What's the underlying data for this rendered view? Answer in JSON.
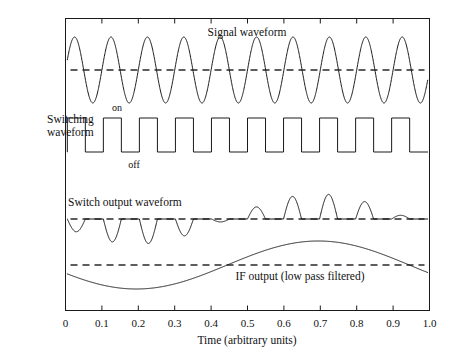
{
  "figure": {
    "x_axis": {
      "title": "Time (arbitrary units)",
      "ticks": [
        "0",
        "0.1",
        "0.2",
        "0.3",
        "0.4",
        "0.5",
        "0.6",
        "0.7",
        "0.8",
        "0.9",
        "1.0"
      ],
      "min": 0,
      "max": 1.0
    },
    "labels": {
      "signal": "Signal waveform",
      "switching_line1": "Switching",
      "switching_line2": "waveform",
      "on": "on",
      "off": "off",
      "switch_output": "Switch output waveform",
      "if_output": "IF output (low pass filtered)"
    },
    "colors": {
      "trace": "#1a1a1a",
      "frame": "#1a1a1a",
      "dashed_reference": "#2a2a2a",
      "background": "#ffffff"
    }
  },
  "chart_data": {
    "type": "line",
    "title": "",
    "xlabel": "Time (arbitrary units)",
    "ylabel": "",
    "xlim": [
      0,
      1.0
    ],
    "grid": false,
    "legend": "none",
    "xticks": [
      0,
      0.1,
      0.2,
      0.3,
      0.4,
      0.5,
      0.6,
      0.7,
      0.8,
      0.9,
      1.0
    ],
    "xticklabels": [
      "0",
      "0.1",
      "0.2",
      "0.3",
      "0.4",
      "0.5",
      "0.6",
      "0.7",
      "0.8",
      "0.9",
      "1.0"
    ],
    "annotations": [
      {
        "text": "Signal waveform",
        "x": 0.48,
        "y_panel": "signal"
      },
      {
        "text": "Switching",
        "x": -0.06,
        "y_panel": "switching"
      },
      {
        "text": "waveform",
        "x": -0.06,
        "y_panel": "switching"
      },
      {
        "text": "on",
        "x": 0.14,
        "y_panel": "switching"
      },
      {
        "text": "off",
        "x": 0.17,
        "y_panel": "switching"
      },
      {
        "text": "Switch output waveform",
        "x": 0.2,
        "y_panel": "switch_output"
      },
      {
        "text": "IF output (low pass filtered)",
        "x": 0.62,
        "y_panel": "if_output"
      }
    ],
    "series": [
      {
        "name": "Signal waveform",
        "panel": "signal",
        "waveform": "sine",
        "cycles": 10,
        "amplitude": 1.0,
        "phase_deg": 0,
        "reference_line": 0,
        "description": "Continuous RF sine wave, 10 cycles across 0 to 1.0 time units, symmetric about the dashed zero reference."
      },
      {
        "name": "Switching waveform",
        "panel": "switching",
        "waveform": "square",
        "cycles": 10,
        "duty": 0.5,
        "high_label": "on",
        "low_label": "off",
        "phase_deg": 0,
        "description": "Local-oscillator square wave gating the switch, 10 cycles, 50 percent duty, levels labelled on and off."
      },
      {
        "name": "Switch output waveform",
        "panel": "switch_output",
        "waveform": "gated_product",
        "cycles": 10,
        "beat_cycles": 1,
        "beat_phase_deg": 200,
        "reference_line": 0,
        "description": "Product of the signal and switching waveforms. Each switching period passes a half cycle of the signal whose polarity and size follow a slow beat envelope, negative excursions early in the record and positive excursions later."
      },
      {
        "name": "IF output (low pass filtered)",
        "panel": "if_output",
        "waveform": "sine",
        "cycles": 1,
        "amplitude": 1.0,
        "phase_deg": 200,
        "reference_line": 0,
        "minimum_at_x": 0.2,
        "maximum_at_x": 0.7,
        "zero_crossings_x": [
          0.45,
          0.95
        ],
        "description": "Low pass filtered beat note, one slow cycle: starts slightly below the reference, dips to a minimum near 0.2, rises through the reference near 0.45, peaks near 0.7 and falls back through the reference near 0.95."
      }
    ]
  }
}
